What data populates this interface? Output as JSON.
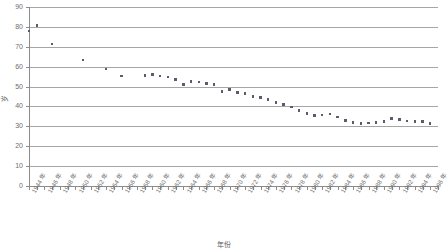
{
  "chart_data": {
    "type": "scatter",
    "title": "",
    "xlabel": "年份",
    "ylabel": "岁",
    "ylim": [
      0,
      90
    ],
    "ytick_values": [
      0,
      10,
      20,
      30,
      40,
      50,
      60,
      70,
      80,
      90
    ],
    "ytick_labels": [
      "0",
      "10",
      "20",
      "30",
      "40",
      "50",
      "60",
      "70",
      "80",
      "90"
    ],
    "grid": true,
    "grid_axis": "y",
    "legend": "none",
    "xlim": [
      1944,
      1997
    ],
    "xtick_labels": [
      "1944 年",
      "1946 年",
      "1948 年",
      "1950 年",
      "1952 年",
      "1954 年",
      "1956 年",
      "1958 年",
      "1960 年",
      "1962 年",
      "1964 年",
      "1966 年",
      "1968 年",
      "1970 年",
      "1972 年",
      "1974 年",
      "1976 年",
      "1978 年",
      "1980 年",
      "1982 年",
      "1984 年",
      "1986 年",
      "1988 年",
      "1990 年",
      "1992 年",
      "1994 年",
      "1996 年"
    ],
    "xtick_values": [
      1944,
      1946,
      1948,
      1950,
      1952,
      1954,
      1956,
      1958,
      1960,
      1962,
      1964,
      1966,
      1968,
      1970,
      1972,
      1974,
      1976,
      1978,
      1980,
      1982,
      1984,
      1986,
      1988,
      1990,
      1992,
      1994,
      1996
    ],
    "x": [
      1944,
      1945,
      1947,
      1951,
      1954,
      1956,
      1959,
      1960,
      1961,
      1962,
      1963,
      1964,
      1965,
      1966,
      1967,
      1968,
      1969,
      1970,
      1971,
      1972,
      1973,
      1974,
      1975,
      1976,
      1977,
      1978,
      1979,
      1980,
      1981,
      1982,
      1983,
      1984,
      1985,
      1986,
      1987,
      1988,
      1989,
      1990,
      1991,
      1992,
      1993,
      1994,
      1995,
      1996
    ],
    "values": [
      78.0,
      80.7,
      71.3,
      63.5,
      58.8,
      55.2,
      55.5,
      56.0,
      55.3,
      54.8,
      53.5,
      51.0,
      52.5,
      52.3,
      51.5,
      51.0,
      47.5,
      48.5,
      47.0,
      46.5,
      45.0,
      44.5,
      43.5,
      42.0,
      41.0,
      39.8,
      38.0,
      36.5,
      35.5,
      35.8,
      36.3,
      34.8,
      33.0,
      32.0,
      31.5,
      31.8,
      32.0,
      32.5,
      34.0,
      33.5,
      32.8,
      32.5,
      32.5,
      31.5
    ],
    "marker": "square",
    "marker_color": "#5b5b6b",
    "axis_color": "#8c8c8c",
    "grid_color": "#a6a6a6",
    "background": "#ffffff"
  }
}
